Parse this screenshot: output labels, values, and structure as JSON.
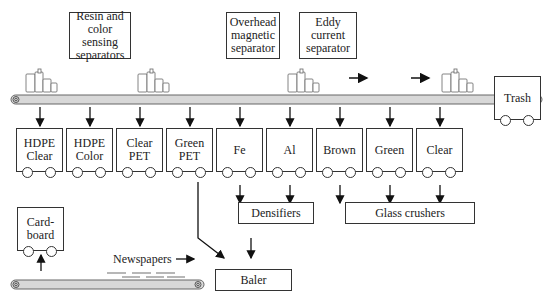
{
  "diagram": {
    "separators": [
      {
        "id": "resin",
        "label": "Resin and color sensing separators"
      },
      {
        "id": "magnetic",
        "label": "Overhead magnetic separator"
      },
      {
        "id": "eddy",
        "label": "Eddy current separator"
      }
    ],
    "separator_lines": {
      "resin": [
        "Resin and",
        "color sensing",
        "separators"
      ],
      "magnetic": [
        "Overhead",
        "magnetic",
        "separator"
      ],
      "eddy": [
        "Eddy",
        "current",
        "separator"
      ]
    },
    "carts": [
      {
        "label": "HDPE\nClear"
      },
      {
        "label": "HDPE\nColor"
      },
      {
        "label": "Clear\nPET"
      },
      {
        "label": "Green\nPET"
      },
      {
        "label": "Fe"
      },
      {
        "label": "Al"
      },
      {
        "label": "Brown"
      },
      {
        "label": "Green"
      },
      {
        "label": "Clear"
      }
    ],
    "trash": {
      "label": "Trash"
    },
    "cardboard": {
      "label": "Card-\nboard"
    },
    "processors": {
      "densifiers": "Densifiers",
      "glass_crushers": "Glass crushers",
      "baler": "Baler"
    },
    "newspapers_label": "Newspapers"
  }
}
